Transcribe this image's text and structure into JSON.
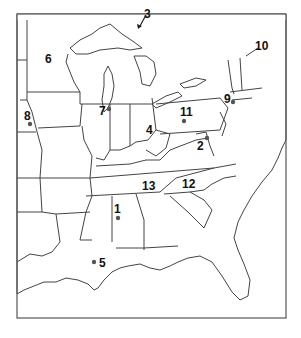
{
  "map": {
    "title": "Eastern United States",
    "markers": [
      {
        "id": "1",
        "label": "1",
        "has_dot": true,
        "location": "Alabama"
      },
      {
        "id": "2",
        "label": "2",
        "has_dot": true,
        "location": "Washington D.C."
      },
      {
        "id": "3",
        "label": "3",
        "has_dot": false,
        "has_arrow": true,
        "location": "Straits of Mackinac"
      },
      {
        "id": "4",
        "label": "4",
        "has_dot": false,
        "location": "Ohio"
      },
      {
        "id": "5",
        "label": "5",
        "has_dot": true,
        "location": "New Orleans"
      },
      {
        "id": "6",
        "label": "6",
        "has_dot": false,
        "location": "Minnesota"
      },
      {
        "id": "7",
        "label": "7",
        "has_dot": true,
        "location": "Chicago"
      },
      {
        "id": "8",
        "label": "8",
        "has_dot": true,
        "location": "Omaha"
      },
      {
        "id": "9",
        "label": "9",
        "has_dot": true,
        "location": "New York City"
      },
      {
        "id": "10",
        "label": "10",
        "has_dot": false,
        "location": "Maine"
      },
      {
        "id": "11",
        "label": "11",
        "has_dot": true,
        "location": "Pennsylvania"
      },
      {
        "id": "12",
        "label": "12",
        "has_dot": false,
        "location": "North Carolina"
      },
      {
        "id": "13",
        "label": "13",
        "has_dot": false,
        "location": "Tennessee"
      }
    ]
  }
}
